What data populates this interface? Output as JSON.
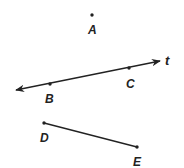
{
  "diagram": {
    "points": [
      {
        "name": "A",
        "label": "A",
        "x": 92,
        "y": 15,
        "lx": 92,
        "ly": 34
      },
      {
        "name": "B",
        "label": "B",
        "x": 50,
        "y": 84,
        "lx": 49,
        "ly": 103
      },
      {
        "name": "C",
        "label": "C",
        "x": 129,
        "y": 68,
        "lx": 130,
        "ly": 88
      },
      {
        "name": "D",
        "label": "D",
        "x": 44,
        "y": 123,
        "lx": 44,
        "ly": 142
      },
      {
        "name": "E",
        "label": "E",
        "x": 137,
        "y": 147,
        "lx": 137,
        "ly": 166
      }
    ],
    "line": {
      "label": "t",
      "through": [
        "B",
        "C"
      ],
      "start": [
        16,
        90
      ],
      "end": [
        160,
        61
      ]
    },
    "segment": {
      "from": "D",
      "to": "E"
    },
    "colors": {
      "stroke": "#222222",
      "background": "#ffffff"
    }
  }
}
